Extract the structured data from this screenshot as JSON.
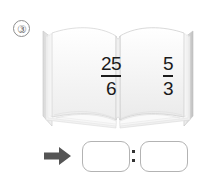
{
  "problem": {
    "number_label": "③",
    "book": {
      "left_page": {
        "fraction": {
          "numerator": "25",
          "denominator": "6"
        }
      },
      "right_page": {
        "fraction": {
          "numerator": "5",
          "denominator": "3"
        }
      }
    },
    "answer": {
      "arrow_icon": "right-arrow-icon",
      "box1_value": "",
      "box1_placeholder": "",
      "separator": ":",
      "box2_value": "",
      "box2_placeholder": ""
    }
  },
  "colors": {
    "ink": "#1b1b1b",
    "outline": "#8d8d8d",
    "box_border": "#b3b3b3",
    "arrow": "#555555",
    "page_fill": "#ffffff",
    "page_shade": "#e8e8e8"
  }
}
